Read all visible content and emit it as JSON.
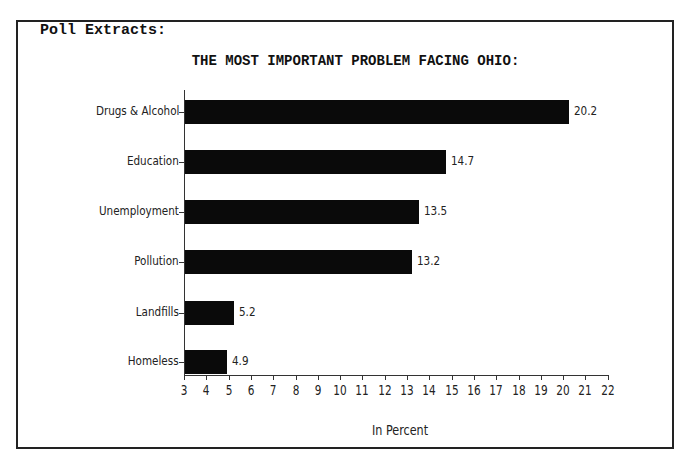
{
  "header": "Poll Extracts:",
  "chart_data": {
    "type": "bar",
    "orientation": "horizontal",
    "title": "THE MOST IMPORTANT PROBLEM FACING OHIO:",
    "categories": [
      "Drugs & Alcohol",
      "Education",
      "Unemployment",
      "Pollution",
      "Landfills",
      "Homeless"
    ],
    "values": [
      20.2,
      14.7,
      13.5,
      13.2,
      5.2,
      4.9
    ],
    "value_labels": [
      "20.2",
      "14.7",
      "13.5",
      "13.2",
      "5.2",
      "4.9"
    ],
    "xlabel": "In Percent",
    "ylabel": "",
    "xlim": [
      3,
      22
    ],
    "xticks": [
      "3",
      "4",
      "5",
      "6",
      "7",
      "8",
      "9",
      "10",
      "11",
      "12",
      "13",
      "14",
      "15",
      "16",
      "17",
      "18",
      "19",
      "20",
      "21",
      "22"
    ],
    "grid": false,
    "legend": null,
    "bar_color": "#0a0a0a"
  }
}
